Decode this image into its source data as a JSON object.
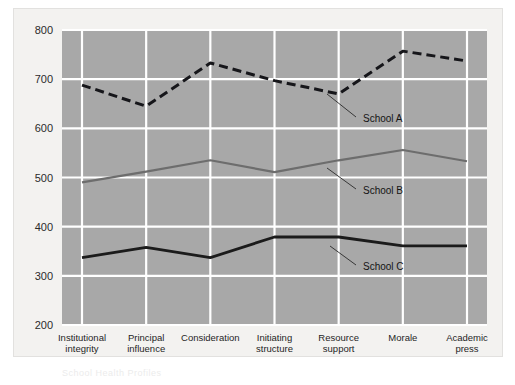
{
  "figure": {
    "background_color": "#ffffff",
    "panel_color": "#f3f2f0",
    "plot_background_color": "#a8a8a8",
    "gridline_color": "#ffffff",
    "caption_fragment": "School Health Profiles"
  },
  "chart_data": {
    "type": "line",
    "title": "",
    "xlabel": "",
    "ylabel": "",
    "ylim": [
      200,
      800
    ],
    "yticks": [
      200,
      300,
      400,
      500,
      600,
      700,
      800
    ],
    "ytick_labels": [
      "200",
      "300",
      "400",
      "500",
      "600",
      "700",
      "800"
    ],
    "grid": true,
    "legend_position": "inline-annotations",
    "categories": [
      "Institutional integrity",
      "Principal influence",
      "Consideration",
      "Initiating structure",
      "Resource support",
      "Morale",
      "Academic press"
    ],
    "category_lines": [
      [
        "Institutional",
        "integrity"
      ],
      [
        "Principal",
        "influence"
      ],
      [
        "Consideration",
        ""
      ],
      [
        "Initiating",
        "structure"
      ],
      [
        "Resource",
        "support"
      ],
      [
        "Morale",
        ""
      ],
      [
        "Academic",
        "press"
      ]
    ],
    "series": [
      {
        "name": "School A",
        "style": "dashed",
        "color": "#16161a",
        "width": 3.0,
        "values": [
          688,
          645,
          733,
          697,
          670,
          757,
          737
        ]
      },
      {
        "name": "School B",
        "style": "solid",
        "color": "#6d6d6d",
        "width": 2.2,
        "values": [
          490,
          512,
          535,
          511,
          535,
          556,
          533
        ]
      },
      {
        "name": "School C",
        "style": "solid",
        "color": "#1b1b1b",
        "width": 2.8,
        "values": [
          337,
          358,
          337,
          379,
          379,
          361,
          361
        ]
      }
    ],
    "annotations": [
      {
        "text": "School A",
        "label_x": 363,
        "label_y": 122,
        "leader_from_x": 356,
        "leader_from_y": 117,
        "leader_to_x": 327,
        "leader_to_y": 94
      },
      {
        "text": "School B",
        "label_x": 363,
        "label_y": 194,
        "leader_from_x": 356,
        "leader_from_y": 189,
        "leader_to_x": 327,
        "leader_to_y": 168
      },
      {
        "text": "School C",
        "label_x": 363,
        "label_y": 270,
        "leader_from_x": 356,
        "leader_from_y": 265,
        "leader_to_x": 330,
        "leader_to_y": 246
      }
    ]
  }
}
